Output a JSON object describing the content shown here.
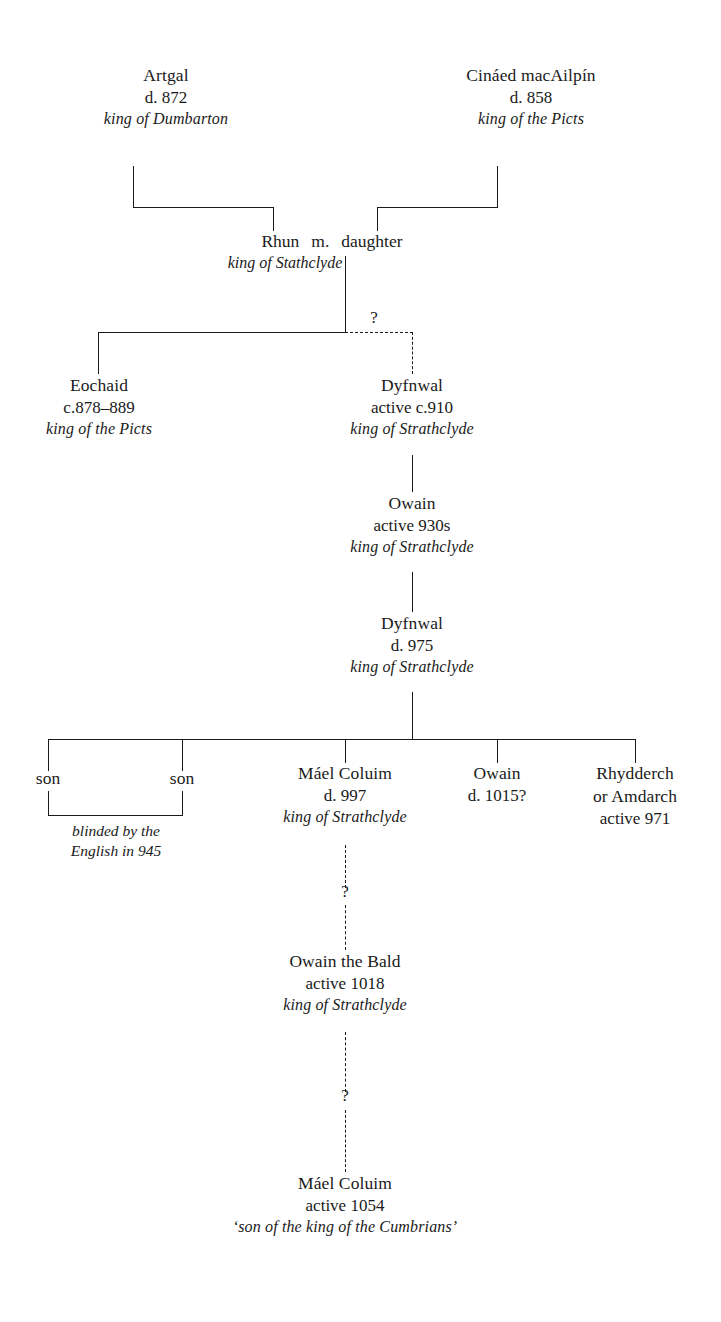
{
  "diagram": {
    "line_color": "#1a1a1a",
    "background": "#ffffff"
  },
  "nodes": {
    "artgal": {
      "name": "Artgal",
      "dates": "d. 872",
      "desc": "king of Dumbarton"
    },
    "cinaed": {
      "name": "Cináed macAilpín",
      "dates": "d. 858",
      "desc": "king of the Picts"
    },
    "rhun": {
      "name": "Rhun",
      "marriage": "m.",
      "spouse": "daughter",
      "desc": "king of Stathclyde"
    },
    "eochaid": {
      "name": "Eochaid",
      "dates": "c.878–889",
      "desc": "king of the Picts"
    },
    "dyfnwal910": {
      "name": "Dyfnwal",
      "dates": "active c.910",
      "desc": "king of Strathclyde"
    },
    "owain930": {
      "name": "Owain",
      "dates": "active 930s",
      "desc": "king of Strathclyde"
    },
    "dyfnwal975": {
      "name": "Dyfnwal",
      "dates": "d. 975",
      "desc": "king of Strathclyde"
    },
    "son1": {
      "name": "son"
    },
    "son2": {
      "name": "son"
    },
    "sons_caption": {
      "line1": "blinded by the",
      "line2": "English in 945"
    },
    "maelcoluim997": {
      "name": "Máel Coluim",
      "dates": "d. 997",
      "desc": "king of Strathclyde"
    },
    "owain1015": {
      "name": "Owain",
      "dates": "d. 1015?"
    },
    "rhydderch": {
      "name": "Rhydderch",
      "alt": "or Amdarch",
      "dates": "active 971"
    },
    "owainbald": {
      "name": "Owain the Bald",
      "dates": "active 1018",
      "desc": "king of Strathclyde"
    },
    "maelcoluim1054": {
      "name": "Máel Coluim",
      "dates": "active 1054",
      "desc": "‘son of the king of the Cumbrians’"
    }
  },
  "markers": {
    "q_rhun_dyfnwal": "?",
    "q_maelcoluim_owainbald": "?",
    "q_owainbald_maelcoluim": "?"
  }
}
